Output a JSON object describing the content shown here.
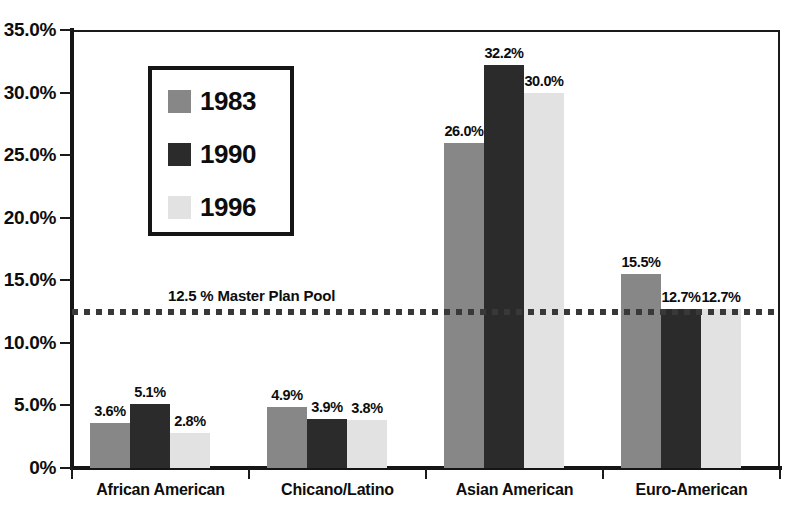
{
  "chart_data": {
    "type": "bar",
    "title": "",
    "xlabel": "",
    "ylabel": "",
    "ylim": [
      0,
      35
    ],
    "grid": false,
    "legend_position": "upper-left-inside",
    "categories": [
      "African American",
      "Chicano/Latino",
      "Asian American",
      "Euro-American"
    ],
    "series": [
      {
        "name": "1983",
        "color": "#878787",
        "values": [
          3.6,
          4.9,
          26.0,
          15.5
        ],
        "labels": [
          "3.6%",
          "4.9%",
          "26.0%",
          "15.5%"
        ]
      },
      {
        "name": "1990",
        "color": "#2b2b2b",
        "values": [
          5.1,
          3.9,
          32.2,
          12.7
        ],
        "labels": [
          "5.1%",
          "3.9%",
          "32.2%",
          "12.7%"
        ]
      },
      {
        "name": "1996",
        "color": "#e2e2e2",
        "values": [
          2.8,
          3.8,
          30.0,
          12.7
        ],
        "labels": [
          "2.8%",
          "3.8%",
          "30.0%",
          "12.7%"
        ]
      }
    ],
    "yticks": [
      0,
      5,
      10,
      15,
      20,
      25,
      30,
      35
    ],
    "ytick_labels": [
      "0%",
      "5.0%",
      "10.0%",
      "15.0%",
      "20.0%",
      "25.0%",
      "30.0%",
      "35.0%"
    ],
    "annotations": [
      {
        "name": "master-plan-pool",
        "value": 12.5,
        "text": "12.5 % Master Plan Pool",
        "style": "dotted-horizontal-line",
        "color": "#383838"
      }
    ]
  },
  "legend": {
    "items": [
      {
        "label": "1983",
        "color": "#878787"
      },
      {
        "label": "1990",
        "color": "#2b2b2b"
      },
      {
        "label": "1996",
        "color": "#e2e2e2"
      }
    ]
  }
}
